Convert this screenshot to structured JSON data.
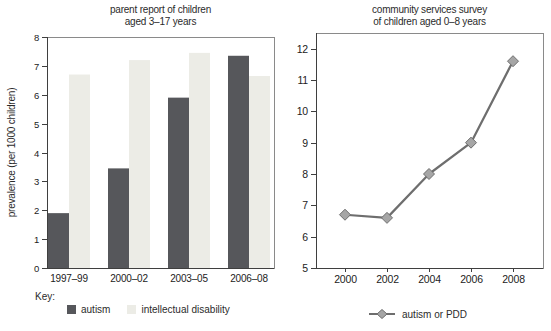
{
  "figure": {
    "background": "#FFFFFF",
    "text_color": "#2B2B2B",
    "axis_color": "#3F3F3F",
    "frame_color": "#8A8A8A"
  },
  "chart_data": [
    {
      "type": "bar",
      "title": "parent report of children aged 3–17 years",
      "title_lines": [
        "parent report of children",
        "aged 3–17 years"
      ],
      "ylabel": "prevalence (per 1000 children)",
      "key_label": "Key:",
      "categories": [
        "1997–99",
        "2000–02",
        "2003–05",
        "2006–08"
      ],
      "series": [
        {
          "name": "autism",
          "color": "#56575B",
          "values": [
            1.9,
            3.45,
            5.9,
            7.35
          ]
        },
        {
          "name": "intellectual disability",
          "color": "#ECECE6",
          "values": [
            6.7,
            7.2,
            7.45,
            6.65
          ]
        }
      ],
      "ylim": [
        0,
        8
      ],
      "yticks": [
        0,
        1,
        2,
        3,
        4,
        5,
        6,
        7,
        8
      ],
      "grid": false,
      "legend_position": "bottom-left"
    },
    {
      "type": "line",
      "title": "community services survey of children aged 0–8 years",
      "title_lines": [
        "community services survey",
        "of children aged 0–8 years"
      ],
      "x": [
        2000,
        2002,
        2004,
        2006,
        2008
      ],
      "xticks": [
        2000,
        2002,
        2004,
        2006,
        2008
      ],
      "series": [
        {
          "name": "autism or PDD",
          "color": "#6E6E6E",
          "marker": "diamond",
          "marker_fill": "#A6A6A6",
          "values": [
            6.7,
            6.6,
            8.0,
            9.0,
            11.6
          ]
        }
      ],
      "ylim": [
        5,
        12.5
      ],
      "yticks": [
        5,
        6,
        7,
        8,
        9,
        10,
        11,
        12
      ],
      "grid": false,
      "legend_position": "bottom-center"
    }
  ]
}
